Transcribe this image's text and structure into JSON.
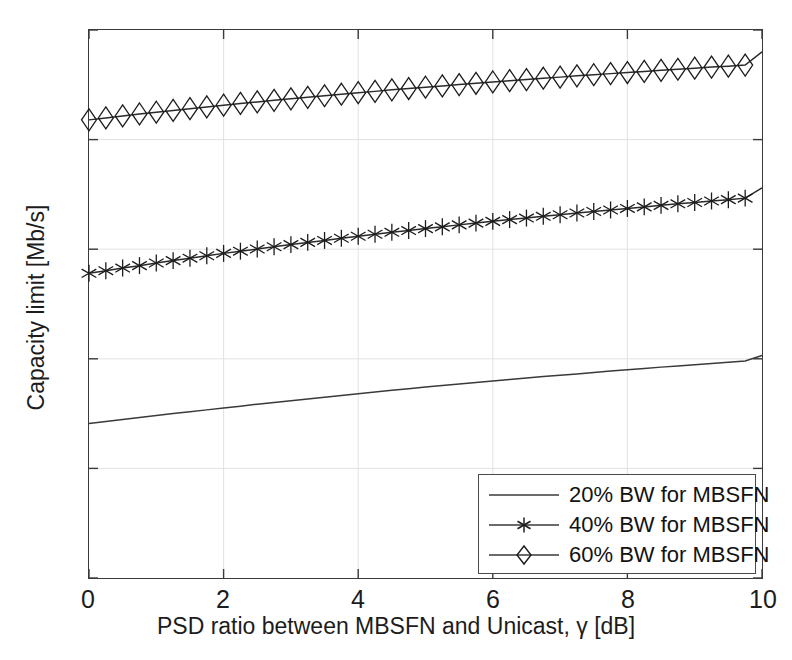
{
  "chart_data": {
    "type": "line",
    "title": "",
    "xlabel": "PSD ratio between MBSFN and Unicast, γ [dB]",
    "ylabel": "Capacity limit [Mb/s]",
    "xlim": [
      0,
      10
    ],
    "ylim": [
      0,
      25
    ],
    "xticks": [
      0,
      2,
      4,
      6,
      8,
      10
    ],
    "yticks": [
      0,
      5,
      10,
      15,
      20,
      25
    ],
    "xtick_labels": [
      "0",
      "2",
      "4",
      "6",
      "8",
      "10"
    ],
    "ytick_labels": [
      "0",
      "5",
      "10",
      "15",
      "20",
      "25"
    ],
    "grid": true,
    "legend_position": "lower right",
    "x": [
      0,
      0.25,
      0.5,
      0.75,
      1,
      1.25,
      1.5,
      1.75,
      2,
      2.25,
      2.5,
      2.75,
      3,
      3.25,
      3.5,
      3.75,
      4,
      4.25,
      4.5,
      4.75,
      5,
      5.25,
      5.5,
      5.75,
      6,
      6.25,
      6.5,
      6.75,
      7,
      7.25,
      7.5,
      7.75,
      8,
      8.25,
      8.5,
      8.75,
      9,
      9.25,
      9.5,
      9.75,
      10
    ],
    "series": [
      {
        "name": "20% BW for MBSFN",
        "marker": "none",
        "color": "#3a3a3a",
        "values": [
          7.05,
          7.14,
          7.23,
          7.32,
          7.41,
          7.5,
          7.58,
          7.67,
          7.76,
          7.84,
          7.93,
          8.01,
          8.09,
          8.17,
          8.25,
          8.33,
          8.41,
          8.48,
          8.56,
          8.63,
          8.71,
          8.78,
          8.85,
          8.92,
          8.99,
          9.06,
          9.12,
          9.19,
          9.25,
          9.31,
          9.38,
          9.44,
          9.5,
          9.56,
          9.62,
          9.67,
          9.73,
          9.79,
          9.84,
          9.9,
          10.15
        ]
      },
      {
        "name": "40% BW for MBSFN",
        "marker": "asterisk",
        "color": "#2a2a2a",
        "values": [
          13.9,
          14.02,
          14.14,
          14.25,
          14.37,
          14.48,
          14.59,
          14.7,
          14.81,
          14.91,
          15.01,
          15.11,
          15.21,
          15.31,
          15.4,
          15.5,
          15.59,
          15.68,
          15.77,
          15.85,
          15.94,
          16.02,
          16.11,
          16.19,
          16.27,
          16.35,
          16.42,
          16.5,
          16.57,
          16.65,
          16.72,
          16.79,
          16.86,
          16.93,
          17.0,
          17.07,
          17.13,
          17.2,
          17.26,
          17.33,
          17.8
        ]
      },
      {
        "name": "60% BW for MBSFN",
        "marker": "diamond",
        "color": "#2a2a2a",
        "values": [
          20.9,
          20.99,
          21.08,
          21.17,
          21.25,
          21.33,
          21.41,
          21.49,
          21.57,
          21.65,
          21.72,
          21.79,
          21.86,
          21.93,
          22.0,
          22.07,
          22.14,
          22.2,
          22.27,
          22.33,
          22.39,
          22.45,
          22.51,
          22.57,
          22.63,
          22.69,
          22.74,
          22.8,
          22.85,
          22.91,
          22.96,
          23.01,
          23.06,
          23.11,
          23.16,
          23.21,
          23.26,
          23.31,
          23.35,
          23.4,
          24.0
        ]
      }
    ]
  },
  "legend": {
    "items": [
      {
        "label": "20% BW for MBSFN",
        "marker": "none"
      },
      {
        "label": "40% BW for MBSFN",
        "marker": "asterisk"
      },
      {
        "label": "60% BW for MBSFN",
        "marker": "diamond"
      }
    ]
  },
  "colors": {
    "axis": "#3a3a3a",
    "grid": "#e2e2e2",
    "line": "#2a2a2a",
    "background": "#ffffff"
  }
}
